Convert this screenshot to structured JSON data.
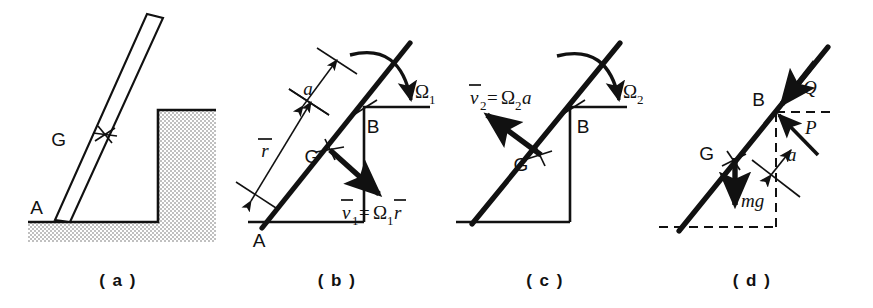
{
  "figure": {
    "background_color": "#ffffff",
    "ink_color": "#111111",
    "hatch_color": "#b4b4b4"
  },
  "panels": [
    {
      "id": "a",
      "caption": "( a )",
      "description": "Rod leaning against a step, contact point A on ground, centre of mass G on rod",
      "labels": {
        "point_a": "A",
        "point_g": "G"
      }
    },
    {
      "id": "b",
      "caption": "( b )",
      "description": "Rod pivoting about A with angular velocity Omega 1; velocity of G is Omega 1 times r-bar",
      "labels": {
        "point_a": "A",
        "point_b": "B",
        "point_g": "G",
        "dim_a": "a",
        "dim_r": "r",
        "omega": "Ω",
        "omega_sub": "1",
        "velocity_lhs_v": "v",
        "velocity_lhs_sub": "1",
        "velocity_eq": "=",
        "velocity_rhs_omega": "Ω",
        "velocity_rhs_sub": "1",
        "velocity_rhs_r": "r"
      }
    },
    {
      "id": "c",
      "caption": "( c )",
      "description": "Rod pivoting about B with angular velocity Omega 2; velocity of G is Omega 2 times a",
      "labels": {
        "point_b": "B",
        "point_g": "G",
        "omega": "Ω",
        "omega_sub": "2",
        "velocity_lhs_v": "v",
        "velocity_lhs_sub": "2",
        "velocity_eq": "=",
        "velocity_rhs_omega": "Ω",
        "velocity_rhs_sub": "2",
        "velocity_rhs_a": "a"
      }
    },
    {
      "id": "d",
      "caption": "( d )",
      "description": "Free-body diagram: impulses P and Q at corner B, weight mg acting at G, angle a",
      "labels": {
        "point_b": "B",
        "point_g": "G",
        "force_q": "Q",
        "force_p": "P",
        "angle_a": "a",
        "weight": "mg"
      }
    }
  ]
}
